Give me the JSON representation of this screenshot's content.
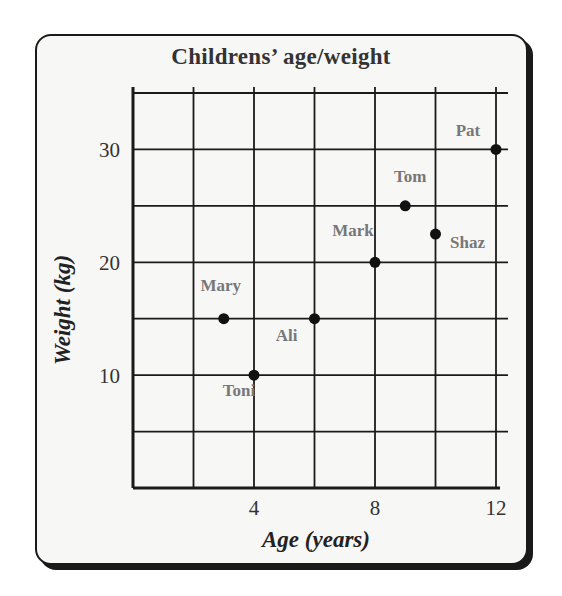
{
  "chart_data": {
    "type": "scatter",
    "title": "Childrens’   age/weight",
    "xlabel": "Age   (years)",
    "ylabel": "Weight   (kg)",
    "xlim": [
      0,
      12
    ],
    "ylim": [
      0,
      35
    ],
    "grid": true,
    "xticks": [
      4,
      8,
      12
    ],
    "yticks": [
      10,
      20,
      30
    ],
    "x_gridlines": [
      0,
      2,
      4,
      6,
      8,
      10,
      12
    ],
    "y_gridlines": [
      0,
      5,
      10,
      15,
      20,
      25,
      30,
      35
    ],
    "points": [
      {
        "name": "Toni",
        "age": 4,
        "weight": 10
      },
      {
        "name": "Mary",
        "age": 3,
        "weight": 15
      },
      {
        "name": "Ali",
        "age": 6,
        "weight": 15
      },
      {
        "name": "Mark",
        "age": 8,
        "weight": 20
      },
      {
        "name": "Shaz",
        "age": 10,
        "weight": 22.5
      },
      {
        "name": "Tom",
        "age": 9,
        "weight": 25
      },
      {
        "name": "Pat",
        "age": 12,
        "weight": 30
      }
    ],
    "colors": {
      "grid": "#1a1a1a",
      "point": "#111111",
      "label": "#777777",
      "axis_text": "#333333"
    }
  }
}
